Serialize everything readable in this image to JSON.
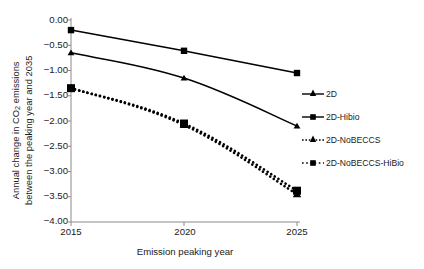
{
  "chart_data": {
    "type": "line",
    "title": "",
    "xlabel": "Emission peaking year",
    "ylabel_line1": "Annual change in CO",
    "ylabel_sub": "2",
    "ylabel_line1_tail": " emissions",
    "ylabel_line2": "between the peaking year and 2035",
    "x": [
      2015,
      2020,
      2025
    ],
    "xtick_labels": [
      "2015",
      "2020",
      "2025"
    ],
    "ytick_labels": [
      "0.00",
      "−0.50",
      "−1.00",
      "−1.50",
      "−2.00",
      "−2.50",
      "−3.00",
      "−3.50",
      "−4.00"
    ],
    "ytick_values": [
      0.0,
      -0.5,
      -1.0,
      -1.5,
      -2.0,
      -2.5,
      -3.0,
      -3.5,
      -4.0
    ],
    "ylim": [
      -4.0,
      0.0
    ],
    "xlim": [
      2015,
      2025
    ],
    "grid": false,
    "legend_position": "right",
    "series": [
      {
        "name": "2D",
        "values": [
          -0.65,
          -1.15,
          -2.1
        ],
        "marker": "triangle",
        "linestyle": "solid",
        "color": "#000000"
      },
      {
        "name": "2D-Hibio",
        "values": [
          -0.2,
          -0.61,
          -1.05
        ],
        "marker": "square",
        "linestyle": "solid",
        "color": "#000000"
      },
      {
        "name": "2D-NoBECCS",
        "values": [
          -1.35,
          -2.08,
          -3.45
        ],
        "marker": "triangle",
        "linestyle": "dotted",
        "color": "#000000"
      },
      {
        "name": "2D-NoBECCS-HiBio",
        "values": [
          -1.35,
          -2.05,
          -3.38
        ],
        "marker": "square",
        "linestyle": "dotted",
        "color": "#000000"
      }
    ]
  },
  "legend": {
    "items": [
      {
        "label": "2D"
      },
      {
        "label": "2D-Hibio"
      },
      {
        "label": "2D-NoBECCS"
      },
      {
        "label": "2D-NoBECCS-HiBio"
      }
    ]
  },
  "colors": {
    "axis": "#8a8a8a",
    "line": "#000000",
    "text": "#1a1a1a",
    "background": "#ffffff"
  }
}
